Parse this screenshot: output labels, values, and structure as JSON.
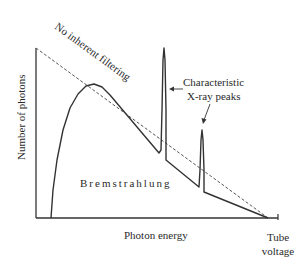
{
  "chart_data": {
    "type": "line",
    "title": "",
    "xlabel": "Photon energy",
    "ylabel": "Number of photons",
    "x_end_label": [
      "Tube",
      "voltage"
    ],
    "grid": false,
    "legend": null,
    "annotations": {
      "dashed_line": "No inherent filtering",
      "peaks": [
        "Characteristic",
        "X-ray peaks"
      ],
      "region": "Bremstrahlung"
    },
    "axis_pixels": {
      "x0": 36,
      "y0": 218,
      "x_end": 278,
      "y_top": 48
    },
    "series": [
      {
        "name": "Bremstrahlung spectrum with characteristic peaks",
        "style": "solid",
        "points_px": [
          [
            51,
            218
          ],
          [
            53,
            190
          ],
          [
            57,
            160
          ],
          [
            63,
            130
          ],
          [
            70,
            108
          ],
          [
            78,
            94
          ],
          [
            86,
            86
          ],
          [
            94,
            84
          ],
          [
            102,
            87
          ],
          [
            110,
            95
          ],
          [
            159,
            153
          ],
          [
            161,
            150
          ],
          [
            162,
            110
          ],
          [
            163,
            60
          ],
          [
            164,
            48
          ],
          [
            165,
            60
          ],
          [
            166,
            110
          ],
          [
            166,
            160
          ],
          [
            199,
            187
          ],
          [
            200,
            170
          ],
          [
            201,
            140
          ],
          [
            202,
            130
          ],
          [
            203,
            140
          ],
          [
            204,
            170
          ],
          [
            204,
            192
          ],
          [
            268,
            218
          ]
        ]
      },
      {
        "name": "No inherent filtering",
        "style": "dashed",
        "points_px": [
          [
            36,
            48
          ],
          [
            268,
            218
          ]
        ]
      }
    ]
  },
  "labels": {
    "ylabel": "Number of photons",
    "xlabel": "Photon energy",
    "tube1": "Tube",
    "tube2": "voltage",
    "dashed": "No inherent filtering",
    "peaks1": "Characteristic",
    "peaks2": "X-ray peaks",
    "region": "Bremstrahlung"
  }
}
